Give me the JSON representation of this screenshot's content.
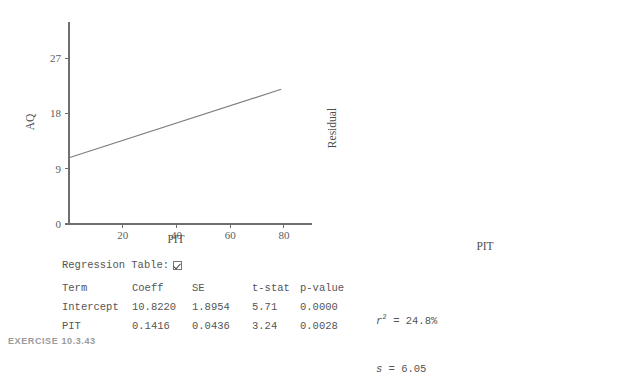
{
  "caption": "EXERCISE 10.3.43",
  "regression_panel": {
    "toggle_label": "Regression Table:",
    "toggle_checked": true,
    "headers": [
      "Term",
      "Coeff",
      "SE",
      "t-stat",
      "p-value"
    ],
    "rows": [
      {
        "term": "Intercept",
        "coeff": "10.8220",
        "se": "1.8954",
        "tstat": "5.71",
        "pvalue": "0.0000"
      },
      {
        "term": "PIT",
        "coeff": "0.1416",
        "se": "0.0436",
        "tstat": "3.24",
        "pvalue": "0.0028"
      }
    ],
    "stats": {
      "r2_label": "r",
      "r2_exponent": "2",
      "r2_eq": " = 24.8%",
      "s_label": "s",
      "s_eq": " = 6.05"
    }
  },
  "chart_data": [
    {
      "id": "scatter",
      "type": "scatter",
      "title": "",
      "xlabel": "PIT",
      "ylabel": "AQ",
      "xlim": [
        0,
        86
      ],
      "ylim": [
        0,
        33
      ],
      "xticks": [
        20,
        40,
        60,
        80
      ],
      "yticks": [
        0,
        9,
        18,
        27
      ],
      "grid": false,
      "legend": "none",
      "x": [
        8.5,
        9.5,
        10.0,
        10.5,
        11.0,
        11.5,
        12.0,
        12.5,
        13.0,
        13.5,
        14.0,
        15.0,
        15.5,
        16.0,
        16.5,
        17.0,
        17.5,
        19.0,
        19.5,
        20.0,
        30.0,
        38.0,
        41.0,
        44.0,
        52.0,
        54.5,
        56.0,
        57.5,
        61.5,
        62.5,
        66.0,
        70.0,
        70.5,
        71.0,
        71.5
      ],
      "y": [
        18.9,
        9.8,
        2.7,
        11.8,
        13.5,
        12.6,
        27.1,
        15.2,
        11.9,
        11.7,
        11.6,
        10.7,
        8.0,
        7.5,
        2.7,
        8.8,
        9.2,
        9.6,
        9.5,
        9.4,
        20.0,
        19.1,
        11.5,
        22.3,
        16.2,
        18.2,
        18.3,
        29.7,
        16.2,
        16.2,
        12.1,
        31.5,
        22.3,
        19.1,
        13.5
      ],
      "fit_line": {
        "equation": "AQ = 10.8220 + 0.1416 * PIT",
        "intercept": 10.822,
        "slope": 0.1416,
        "x_start": 0,
        "x_end": 79
      }
    },
    {
      "id": "residual",
      "type": "scatter",
      "title": "",
      "xlabel": "PIT",
      "ylabel": "Residual",
      "xlim": [
        0,
        86
      ],
      "ylim": [
        -16,
        16
      ],
      "xticks": [
        20,
        40,
        60,
        80
      ],
      "yticks": [
        -16,
        -8,
        0,
        8,
        16
      ],
      "grid": false,
      "legend": "none",
      "x": [
        8.5,
        9.5,
        10.0,
        10.5,
        11.0,
        11.5,
        12.0,
        12.5,
        13.0,
        13.5,
        14.0,
        15.0,
        15.5,
        16.0,
        16.5,
        17.0,
        17.5,
        19.0,
        19.5,
        20.5,
        21.5,
        31.5,
        40.5,
        43.0,
        46.0,
        53.5,
        55.0,
        55.5,
        58.0,
        63.5,
        64.5,
        67.5,
        72.0,
        72.5,
        73.5
      ],
      "y": [
        6.9,
        -2.2,
        -10.7,
        -0.5,
        1.1,
        0.2,
        14.4,
        2.6,
        -0.7,
        -1.2,
        -1.4,
        -2.6,
        -5.1,
        -6.0,
        -11.4,
        -3.8,
        -3.3,
        -3.6,
        -3.8,
        -3.9,
        -3.4,
        5.3,
        3.1,
        -5.1,
        6.3,
        -1.9,
        -0.1,
        -0.2,
        -0.3,
        -4.1,
        -4.2,
        -7.8,
        2.6,
        -7.7,
        -7.8
      ],
      "zero_line": {
        "y": 0
      }
    }
  ]
}
